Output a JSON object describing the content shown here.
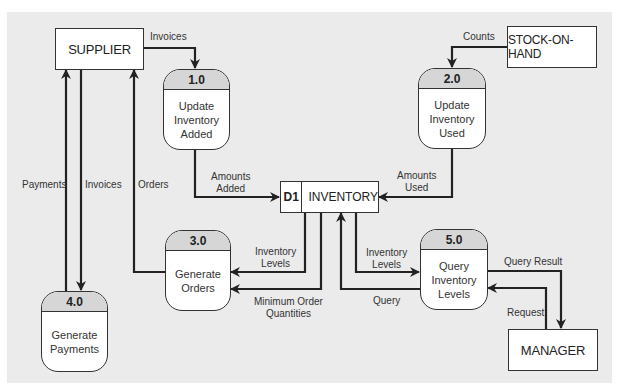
{
  "diagram": {
    "type": "data-flow-diagram",
    "background_color": "#ebebeb",
    "line_color": "#222222",
    "external_entities": [
      {
        "id": "supplier",
        "label": "SUPPLIER"
      },
      {
        "id": "stock_on_hand",
        "label": "STOCK-ON-HAND"
      },
      {
        "id": "manager",
        "label": "MANAGER"
      }
    ],
    "processes": [
      {
        "id": "1.0",
        "name": "Update\nInventory\nAdded"
      },
      {
        "id": "2.0",
        "name": "Update\nInventory\nUsed"
      },
      {
        "id": "3.0",
        "name": "Generate\nOrders"
      },
      {
        "id": "4.0",
        "name": "Generate\nPayments"
      },
      {
        "id": "5.0",
        "name": "Query\nInventory\nLevels"
      }
    ],
    "data_stores": [
      {
        "id": "D1",
        "name": "INVENTORY"
      }
    ],
    "flows": [
      {
        "from": "SUPPLIER",
        "to": "1.0",
        "label": "Invoices"
      },
      {
        "from": "STOCK-ON-HAND",
        "to": "2.0",
        "label": "Counts"
      },
      {
        "from": "1.0",
        "to": "D1",
        "label": "Amounts\nAdded"
      },
      {
        "from": "2.0",
        "to": "D1",
        "label": "Amounts\nUsed"
      },
      {
        "from": "D1",
        "to": "3.0",
        "label": "Inventory\nLevels"
      },
      {
        "from": "D1",
        "to": "3.0",
        "label": "Minimum Order\nQuantities"
      },
      {
        "from": "3.0",
        "to": "SUPPLIER",
        "label": "Orders"
      },
      {
        "from": "SUPPLIER",
        "to": "4.0",
        "label": "Invoices"
      },
      {
        "from": "4.0",
        "to": "SUPPLIER",
        "label": "Payments"
      },
      {
        "from": "D1",
        "to": "5.0",
        "label": "Inventory\nLevels"
      },
      {
        "from": "5.0",
        "to": "D1",
        "label": "Query"
      },
      {
        "from": "5.0",
        "to": "MANAGER",
        "label": "Query Result"
      },
      {
        "from": "MANAGER",
        "to": "5.0",
        "label": "Request"
      }
    ]
  }
}
